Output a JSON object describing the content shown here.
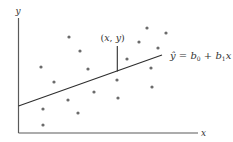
{
  "diagram": {
    "axis_labels": {
      "x": "x",
      "y": "y"
    },
    "point_label": "(x, y)",
    "equation": {
      "yhat": "ŷ",
      "eq": " = ",
      "b0": "b",
      "b0_sub": "0",
      "plus": " + ",
      "b1": "b",
      "b1_sub": "1",
      "x": "x"
    },
    "colors": {
      "axis": "#5a5a5a",
      "line": "#2e2e2e",
      "points": "#6b6b6b",
      "text": "#333333"
    }
  },
  "chart_data": {
    "type": "scatter",
    "title": "",
    "xlabel": "x",
    "ylabel": "y",
    "grid": false,
    "note": "Pixel coordinates (x right, y down) of scatter points within 233x142 image; axes origin at (18.5, 133)",
    "points": [
      [
        69,
        37
      ],
      [
        80,
        51
      ],
      [
        41,
        67
      ],
      [
        88,
        69
      ],
      [
        54,
        82
      ],
      [
        94,
        92
      ],
      [
        68,
        100
      ],
      [
        43,
        109
      ],
      [
        78,
        113
      ],
      [
        43,
        125
      ],
      [
        117,
        80
      ],
      [
        118,
        98
      ],
      [
        127,
        59
      ],
      [
        139,
        42
      ],
      [
        147,
        28
      ],
      [
        158,
        48
      ],
      [
        166,
        33
      ],
      [
        151,
        68
      ],
      [
        152,
        87
      ]
    ],
    "regression_line": {
      "from": [
        18.5,
        106
      ],
      "to": [
        162,
        55
      ],
      "label": "ŷ = b0 + b1x"
    },
    "highlighted_point": {
      "at": [
        117.3,
        46
      ],
      "label": "(x, y)",
      "residual_to_line_y": 71.5
    }
  }
}
